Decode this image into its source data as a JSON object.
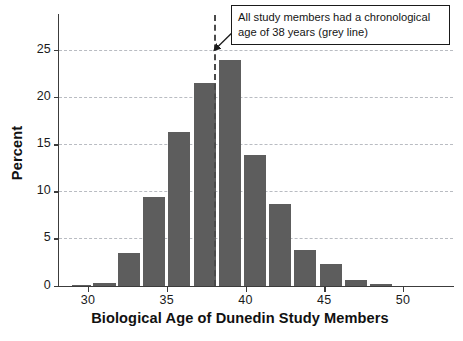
{
  "chart_data": {
    "type": "bar",
    "title": "",
    "subtitle": "",
    "xlabel": "Biological Age of Dunedin Study Members",
    "ylabel": "Percent",
    "xlim": [
      28.3,
      53.5
    ],
    "ylim": [
      0,
      28.5
    ],
    "grid": true,
    "legend": "none",
    "bin_width": 1,
    "x_ticks": [
      30,
      35,
      40,
      45,
      50
    ],
    "y_ticks": [
      0,
      5,
      10,
      15,
      20,
      25
    ],
    "bar_color": "#5d5d5d",
    "gridline_color": "#b9bcc2",
    "axis_color": "#3c3c3c",
    "categories": [
      "29-30",
      "30-31",
      "31-32",
      "32-33",
      "33-34",
      "34-35",
      "35-36",
      "36-37",
      "37-38",
      "38-39",
      "39-40",
      "40-41",
      "41-42",
      "42-43",
      "43-44",
      "44-45",
      "45-46",
      "46-47",
      "47-48",
      "48-49"
    ],
    "bin_starts": [
      29,
      30,
      31,
      32,
      33,
      34,
      35,
      36,
      37,
      38,
      39,
      40,
      41,
      42,
      43,
      44,
      45,
      46,
      47,
      48
    ],
    "values": [
      0.15,
      0.35,
      0.0,
      3.5,
      0.0,
      9.4,
      0.0,
      16.3,
      21.5,
      24.0,
      13.9,
      0.0,
      8.7,
      0.0,
      3.8,
      0.0,
      2.3,
      0.6,
      0.0,
      0.2
    ],
    "bars": [
      {
        "start": 29.0,
        "end": 30.3,
        "value": 0.15
      },
      {
        "start": 30.3,
        "end": 31.9,
        "value": 0.35
      },
      {
        "start": 31.9,
        "end": 33.4,
        "value": 3.5
      },
      {
        "start": 33.5,
        "end": 35.0,
        "value": 9.4
      },
      {
        "start": 35.1,
        "end": 36.6,
        "value": 16.3
      },
      {
        "start": 36.7,
        "end": 38.2,
        "value": 21.5
      },
      {
        "start": 38.3,
        "end": 39.8,
        "value": 24.0
      },
      {
        "start": 39.9,
        "end": 41.4,
        "value": 13.9
      },
      {
        "start": 41.5,
        "end": 43.0,
        "value": 8.7
      },
      {
        "start": 43.1,
        "end": 44.6,
        "value": 3.8
      },
      {
        "start": 44.7,
        "end": 46.2,
        "value": 2.3
      },
      {
        "start": 46.3,
        "end": 47.8,
        "value": 0.6
      },
      {
        "start": 47.9,
        "end": 49.4,
        "value": 0.2
      }
    ],
    "reference_line": {
      "x": 38,
      "style": "dashed",
      "color": "#4a4a4a",
      "label": "grey line"
    },
    "annotations": [
      {
        "text": "All study members had a chronological age of 38 years (grey line)",
        "line1": "All study members had a chronological",
        "line2": "age of 38 years (grey line)",
        "points_to_x": 38,
        "points_to_y": 25.5,
        "boxed": true
      }
    ]
  },
  "axes": {
    "y_title": "Percent",
    "x_title": "Biological Age of Dunedin Study Members",
    "y_tick_labels": [
      "0",
      "5",
      "10",
      "15",
      "20",
      "25"
    ],
    "x_tick_labels": [
      "30",
      "35",
      "40",
      "45",
      "50"
    ]
  },
  "annotation": {
    "line1": "All study members had a chronological",
    "line2": "age of 38 years (grey line)"
  }
}
